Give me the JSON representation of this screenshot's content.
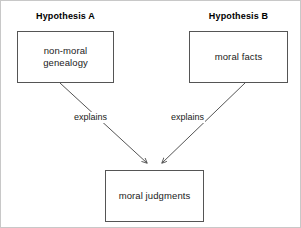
{
  "diagram": {
    "background_color": "#ffffff",
    "stroke_color": "#555555",
    "text_color": "#1a1a1a",
    "headings": [
      {
        "id": "a",
        "text": "Hypothesis A"
      },
      {
        "id": "b",
        "text": "Hypothesis B"
      }
    ],
    "nodes": [
      {
        "id": "a",
        "text": "non-moral\ngenealogy",
        "x": 16,
        "y": 30,
        "width": 97,
        "height": 52
      },
      {
        "id": "b",
        "text": "moral facts",
        "x": 188,
        "y": 30,
        "width": 99,
        "height": 52
      },
      {
        "id": "c",
        "text": "moral judgments",
        "x": 104,
        "y": 169,
        "width": 99,
        "height": 52
      }
    ],
    "edges": [
      {
        "id": "a-to-c",
        "from": "a",
        "to": "c",
        "label": "explains",
        "x1": 59,
        "y1": 82,
        "x2": 146,
        "y2": 162
      },
      {
        "id": "b-to-c",
        "from": "b",
        "to": "c",
        "label": "explains",
        "x1": 244,
        "y1": 82,
        "x2": 161,
        "y2": 162
      }
    ]
  }
}
